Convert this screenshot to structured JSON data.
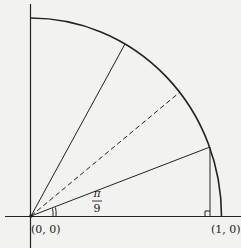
{
  "diagram": {
    "type": "unit-circle-quarter",
    "labels": {
      "origin": "(0, 0)",
      "point_x": "(1, 0)",
      "angle_numerator": "π",
      "angle_denominator": "9"
    },
    "rays_deg": [
      20,
      40,
      60
    ],
    "dashed_ray_deg": 40,
    "colors": {
      "ink": "#222222",
      "background": "#f2f2f0"
    }
  }
}
